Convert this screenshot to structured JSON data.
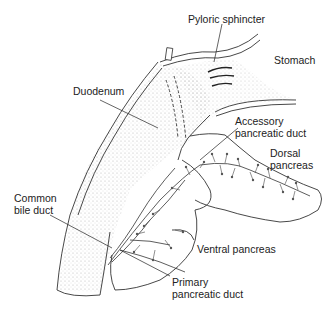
{
  "figure": {
    "labels": {
      "pyloric_sphincter": "Pyloric sphincter",
      "stomach": "Stomach",
      "duodenum": "Duodenum",
      "accessory_duct_1": "Accessory",
      "accessory_duct_2": "pancreatic duct",
      "dorsal_1": "Dorsal",
      "dorsal_2": "pancreas",
      "common_bile_1": "Common",
      "common_bile_2": "bile duct",
      "ventral": "Ventral pancreas",
      "primary_duct_1": "Primary",
      "primary_duct_2": "pancreatic duct"
    },
    "colors": {
      "line": "#333333",
      "stipple": "#9a9a9a",
      "background": "#ffffff"
    }
  }
}
